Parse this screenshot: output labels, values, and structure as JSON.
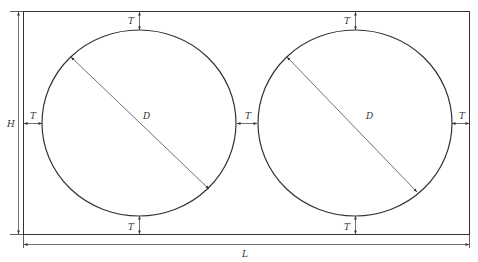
{
  "diagram": {
    "labels": {
      "height": "H",
      "length": "L",
      "diameter_left": "D",
      "diameter_right": "D",
      "gap_left_top": "T",
      "gap_left_bottom": "T",
      "gap_left_side": "T",
      "gap_middle": "T",
      "gap_right_top": "T",
      "gap_right_bottom": "T",
      "gap_right_side": "T"
    },
    "colors": {
      "stroke": "#333333",
      "background": "#ffffff"
    }
  }
}
